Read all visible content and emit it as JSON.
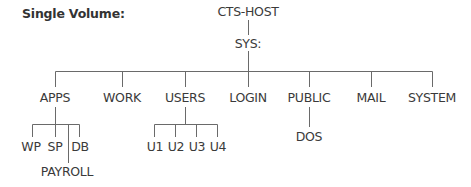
{
  "diagram": {
    "title": "Single Volume:",
    "root": "CTS-HOST",
    "volume": "SYS:",
    "directories": [
      {
        "name": "APPS",
        "children": [
          "WP",
          "SP",
          "DB",
          "PAYROLL"
        ]
      },
      {
        "name": "WORK",
        "children": []
      },
      {
        "name": "USERS",
        "children": [
          "U1",
          "U2",
          "U3",
          "U4"
        ]
      },
      {
        "name": "LOGIN",
        "children": []
      },
      {
        "name": "PUBLIC",
        "children": [
          "DOS"
        ]
      },
      {
        "name": "MAIL",
        "children": []
      },
      {
        "name": "SYSTEM",
        "children": []
      }
    ]
  },
  "labels": {
    "title": "Single Volume:",
    "root": "CTS-HOST",
    "volume": "SYS:",
    "apps": "APPS",
    "work": "WORK",
    "users": "USERS",
    "login": "LOGIN",
    "public": "PUBLIC",
    "mail": "MAIL",
    "system": "SYSTEM",
    "wp": "WP",
    "sp": "SP",
    "db": "DB",
    "payroll": "PAYROLL",
    "u1": "U1",
    "u2": "U2",
    "u3": "U3",
    "u4": "U4",
    "dos": "DOS"
  },
  "colors": {
    "line": "#6a6a6a",
    "text": "#3a3a3a",
    "background": "#ffffff"
  }
}
